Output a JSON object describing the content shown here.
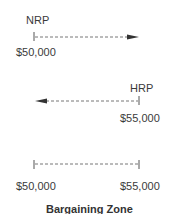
{
  "diagram": {
    "nrp": {
      "label": "NRP",
      "value": "$50,000",
      "direction": "right"
    },
    "hrp": {
      "label": "HRP",
      "value": "$55,000",
      "direction": "left"
    },
    "zone": {
      "low_value": "$50,000",
      "high_value": "$55,000",
      "title": "Bargaining Zone"
    },
    "colors": {
      "line": "#555555",
      "text": "#3a3a3a"
    }
  }
}
